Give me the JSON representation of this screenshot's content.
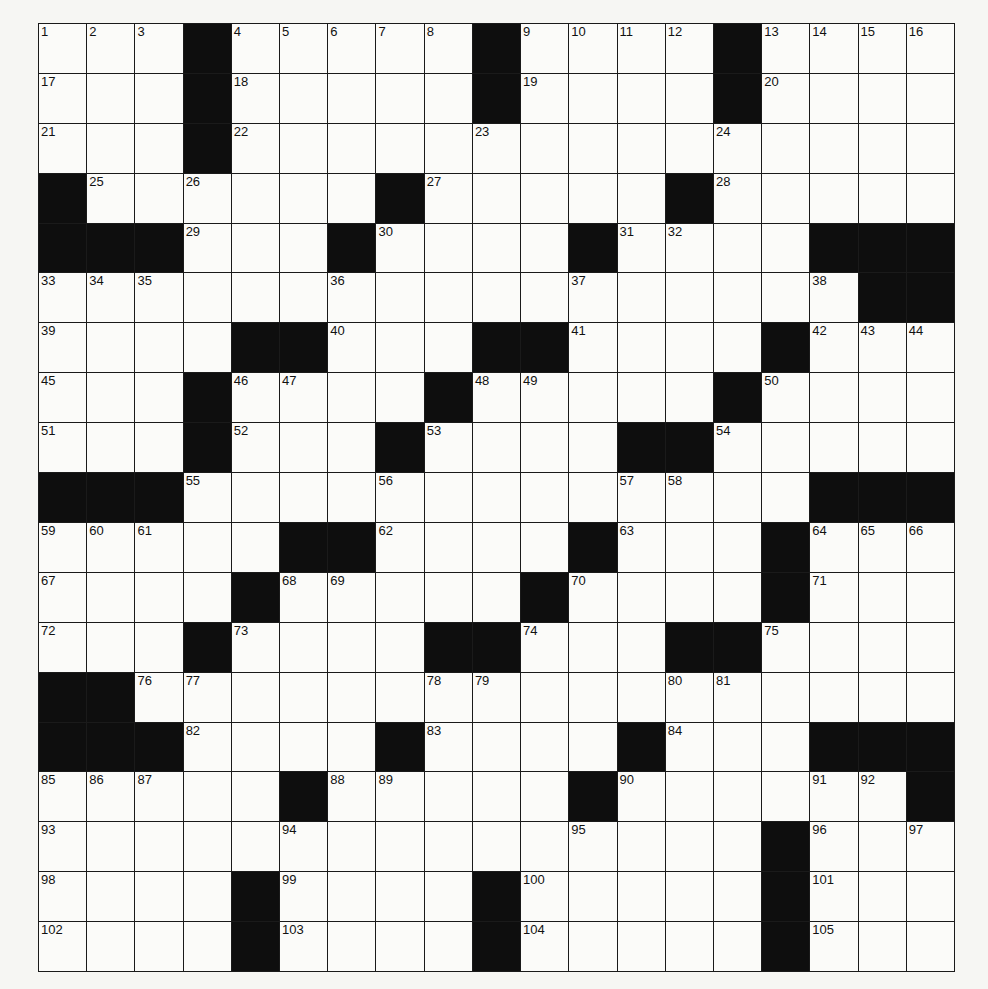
{
  "puzzle": {
    "rows": 19,
    "cols": 19,
    "layout": [
      "...#.....#....#....",
      "...#.....#....#....",
      "...#...............",
      "#......#.....#.....",
      "###...#....#....###",
      ".................##",
      "....##...##....#...",
      "...#....#.....#....",
      "...#...#....##.....",
      "###.............###",
      ".....##....#...#...",
      "....#.....#....#...",
      "...#....##...##....",
      "##.................",
      "###....#....#...###",
      ".....#.....#......#",
      "...............#...",
      "....#....#.....#...",
      "....#....#.....#..."
    ],
    "numbers": [
      {
        "r": 0,
        "c": 0,
        "n": "1"
      },
      {
        "r": 0,
        "c": 1,
        "n": "2"
      },
      {
        "r": 0,
        "c": 2,
        "n": "3"
      },
      {
        "r": 0,
        "c": 4,
        "n": "4"
      },
      {
        "r": 0,
        "c": 5,
        "n": "5"
      },
      {
        "r": 0,
        "c": 6,
        "n": "6"
      },
      {
        "r": 0,
        "c": 7,
        "n": "7"
      },
      {
        "r": 0,
        "c": 8,
        "n": "8"
      },
      {
        "r": 0,
        "c": 10,
        "n": "9"
      },
      {
        "r": 0,
        "c": 11,
        "n": "10"
      },
      {
        "r": 0,
        "c": 12,
        "n": "11"
      },
      {
        "r": 0,
        "c": 13,
        "n": "12"
      },
      {
        "r": 0,
        "c": 15,
        "n": "13"
      },
      {
        "r": 0,
        "c": 16,
        "n": "14"
      },
      {
        "r": 0,
        "c": 17,
        "n": "15"
      },
      {
        "r": 0,
        "c": 18,
        "n": "16"
      },
      {
        "r": 1,
        "c": 0,
        "n": "17"
      },
      {
        "r": 1,
        "c": 4,
        "n": "18"
      },
      {
        "r": 1,
        "c": 10,
        "n": "19"
      },
      {
        "r": 1,
        "c": 15,
        "n": "20"
      },
      {
        "r": 2,
        "c": 0,
        "n": "21"
      },
      {
        "r": 2,
        "c": 4,
        "n": "22"
      },
      {
        "r": 2,
        "c": 9,
        "n": "23"
      },
      {
        "r": 2,
        "c": 14,
        "n": "24"
      },
      {
        "r": 3,
        "c": 1,
        "n": "25"
      },
      {
        "r": 3,
        "c": 3,
        "n": "26"
      },
      {
        "r": 3,
        "c": 8,
        "n": "27"
      },
      {
        "r": 3,
        "c": 14,
        "n": "28"
      },
      {
        "r": 4,
        "c": 3,
        "n": "29"
      },
      {
        "r": 4,
        "c": 7,
        "n": "30"
      },
      {
        "r": 4,
        "c": 12,
        "n": "31"
      },
      {
        "r": 4,
        "c": 13,
        "n": "32"
      },
      {
        "r": 5,
        "c": 0,
        "n": "33"
      },
      {
        "r": 5,
        "c": 1,
        "n": "34"
      },
      {
        "r": 5,
        "c": 2,
        "n": "35"
      },
      {
        "r": 5,
        "c": 6,
        "n": "36"
      },
      {
        "r": 5,
        "c": 11,
        "n": "37"
      },
      {
        "r": 5,
        "c": 16,
        "n": "38"
      },
      {
        "r": 6,
        "c": 0,
        "n": "39"
      },
      {
        "r": 6,
        "c": 6,
        "n": "40"
      },
      {
        "r": 6,
        "c": 11,
        "n": "41"
      },
      {
        "r": 6,
        "c": 16,
        "n": "42"
      },
      {
        "r": 6,
        "c": 17,
        "n": "43"
      },
      {
        "r": 6,
        "c": 18,
        "n": "44"
      },
      {
        "r": 7,
        "c": 0,
        "n": "45"
      },
      {
        "r": 7,
        "c": 4,
        "n": "46"
      },
      {
        "r": 7,
        "c": 5,
        "n": "47"
      },
      {
        "r": 7,
        "c": 9,
        "n": "48"
      },
      {
        "r": 7,
        "c": 10,
        "n": "49"
      },
      {
        "r": 7,
        "c": 15,
        "n": "50"
      },
      {
        "r": 8,
        "c": 0,
        "n": "51"
      },
      {
        "r": 8,
        "c": 4,
        "n": "52"
      },
      {
        "r": 8,
        "c": 8,
        "n": "53"
      },
      {
        "r": 8,
        "c": 14,
        "n": "54"
      },
      {
        "r": 9,
        "c": 3,
        "n": "55"
      },
      {
        "r": 9,
        "c": 7,
        "n": "56"
      },
      {
        "r": 9,
        "c": 12,
        "n": "57"
      },
      {
        "r": 9,
        "c": 13,
        "n": "58"
      },
      {
        "r": 10,
        "c": 0,
        "n": "59"
      },
      {
        "r": 10,
        "c": 1,
        "n": "60"
      },
      {
        "r": 10,
        "c": 2,
        "n": "61"
      },
      {
        "r": 10,
        "c": 7,
        "n": "62"
      },
      {
        "r": 10,
        "c": 12,
        "n": "63"
      },
      {
        "r": 10,
        "c": 16,
        "n": "64"
      },
      {
        "r": 10,
        "c": 17,
        "n": "65"
      },
      {
        "r": 10,
        "c": 18,
        "n": "66"
      },
      {
        "r": 11,
        "c": 0,
        "n": "67"
      },
      {
        "r": 11,
        "c": 5,
        "n": "68"
      },
      {
        "r": 11,
        "c": 6,
        "n": "69"
      },
      {
        "r": 11,
        "c": 11,
        "n": "70"
      },
      {
        "r": 11,
        "c": 16,
        "n": "71"
      },
      {
        "r": 12,
        "c": 0,
        "n": "72"
      },
      {
        "r": 12,
        "c": 4,
        "n": "73"
      },
      {
        "r": 12,
        "c": 10,
        "n": "74"
      },
      {
        "r": 12,
        "c": 15,
        "n": "75"
      },
      {
        "r": 13,
        "c": 2,
        "n": "76"
      },
      {
        "r": 13,
        "c": 3,
        "n": "77"
      },
      {
        "r": 13,
        "c": 8,
        "n": "78"
      },
      {
        "r": 13,
        "c": 9,
        "n": "79"
      },
      {
        "r": 13,
        "c": 13,
        "n": "80"
      },
      {
        "r": 13,
        "c": 14,
        "n": "81"
      },
      {
        "r": 14,
        "c": 3,
        "n": "82"
      },
      {
        "r": 14,
        "c": 8,
        "n": "83"
      },
      {
        "r": 14,
        "c": 13,
        "n": "84"
      },
      {
        "r": 15,
        "c": 0,
        "n": "85"
      },
      {
        "r": 15,
        "c": 1,
        "n": "86"
      },
      {
        "r": 15,
        "c": 2,
        "n": "87"
      },
      {
        "r": 15,
        "c": 6,
        "n": "88"
      },
      {
        "r": 15,
        "c": 7,
        "n": "89"
      },
      {
        "r": 15,
        "c": 12,
        "n": "90"
      },
      {
        "r": 15,
        "c": 16,
        "n": "91"
      },
      {
        "r": 15,
        "c": 17,
        "n": "92"
      },
      {
        "r": 16,
        "c": 0,
        "n": "93"
      },
      {
        "r": 16,
        "c": 5,
        "n": "94"
      },
      {
        "r": 16,
        "c": 11,
        "n": "95"
      },
      {
        "r": 16,
        "c": 16,
        "n": "96"
      },
      {
        "r": 16,
        "c": 18,
        "n": "97"
      },
      {
        "r": 17,
        "c": 0,
        "n": "98"
      },
      {
        "r": 17,
        "c": 5,
        "n": "99"
      },
      {
        "r": 17,
        "c": 10,
        "n": "100"
      },
      {
        "r": 17,
        "c": 16,
        "n": "101"
      },
      {
        "r": 18,
        "c": 0,
        "n": "102"
      },
      {
        "r": 18,
        "c": 5,
        "n": "103"
      },
      {
        "r": 18,
        "c": 10,
        "n": "104"
      },
      {
        "r": 18,
        "c": 16,
        "n": "105"
      }
    ]
  },
  "colors": {
    "block": "#0e0e0e",
    "cell": "#fbfbf9",
    "line": "#1a1a1a",
    "page": "#f6f6f3"
  }
}
